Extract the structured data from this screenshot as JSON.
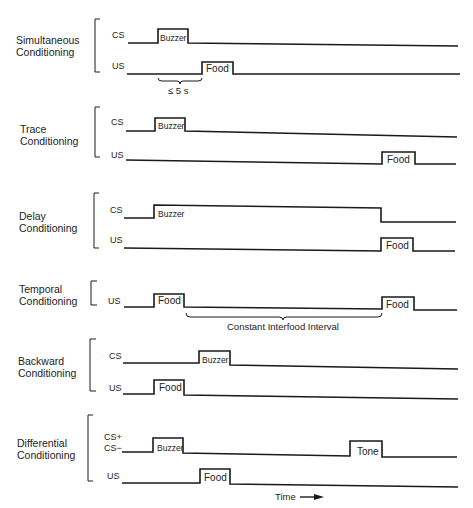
{
  "diagram": {
    "type": "timing-diagram",
    "topic": "Classical conditioning procedures",
    "groups": [
      {
        "name": "Simultaneous Conditioning",
        "label_lines": [
          "Simultaneous",
          "Conditioning"
        ],
        "signals": [
          {
            "label": "CS",
            "pulses": [
              {
                "label": "Buzzer"
              }
            ]
          },
          {
            "label": "US",
            "pulses": [
              {
                "label": "Food"
              }
            ]
          }
        ],
        "annotation": "≤ 5 s"
      },
      {
        "name": "Trace Conditioning",
        "label_lines": [
          "Trace",
          "Conditioning"
        ],
        "signals": [
          {
            "label": "CS",
            "pulses": [
              {
                "label": "Buzzer"
              }
            ]
          },
          {
            "label": "US",
            "pulses": [
              {
                "label": "Food"
              }
            ]
          }
        ]
      },
      {
        "name": "Delay Conditioning",
        "label_lines": [
          "Delay",
          "Conditioning"
        ],
        "signals": [
          {
            "label": "CS",
            "pulses": [
              {
                "label": "Buzzer"
              }
            ]
          },
          {
            "label": "US",
            "pulses": [
              {
                "label": "Food"
              }
            ]
          }
        ]
      },
      {
        "name": "Temporal Conditioning",
        "label_lines": [
          "Temporal",
          "Conditioning"
        ],
        "signals": [
          {
            "label": "US",
            "pulses": [
              {
                "label": "Food"
              },
              {
                "label": "Food"
              }
            ]
          }
        ],
        "annotation": "Constant Interfood Interval"
      },
      {
        "name": "Backward Conditioning",
        "label_lines": [
          "Backward",
          "Conditioning"
        ],
        "signals": [
          {
            "label": "CS",
            "pulses": [
              {
                "label": "Buzzer"
              }
            ]
          },
          {
            "label": "US",
            "pulses": [
              {
                "label": "Food"
              }
            ]
          }
        ]
      },
      {
        "name": "Differential Conditioning",
        "label_lines": [
          "Differential",
          "Conditioning"
        ],
        "signals": [
          {
            "label": "CS+",
            "label2": "CS−",
            "pulses": [
              {
                "label": "Buzzer"
              },
              {
                "label": "Tone"
              }
            ]
          },
          {
            "label": "US",
            "pulses": [
              {
                "label": "Food"
              }
            ]
          }
        ]
      }
    ],
    "axis": {
      "label": "Time",
      "arrow": "right-arrow"
    }
  }
}
